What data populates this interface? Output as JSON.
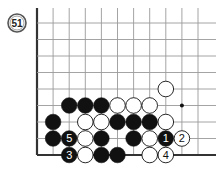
{
  "diagram": {
    "problem_number": "51",
    "grid": {
      "origin_x": 37,
      "origin_y": 23,
      "spacing_x": 16.1,
      "spacing_y": 16.5,
      "cols": 11,
      "rows": 9,
      "edges": [
        "left",
        "bottom"
      ],
      "line_color": "#9a9a9a",
      "edge_color": "#333333"
    },
    "star_points": [
      {
        "col": 9,
        "row": 5
      }
    ],
    "stones": [
      {
        "col": 8,
        "row": 4,
        "color": "white"
      },
      {
        "col": 2,
        "row": 5,
        "color": "black"
      },
      {
        "col": 3,
        "row": 5,
        "color": "black"
      },
      {
        "col": 4,
        "row": 5,
        "color": "black"
      },
      {
        "col": 5,
        "row": 5,
        "color": "white"
      },
      {
        "col": 6,
        "row": 5,
        "color": "white"
      },
      {
        "col": 7,
        "row": 5,
        "color": "white"
      },
      {
        "col": 1,
        "row": 6,
        "color": "black"
      },
      {
        "col": 3,
        "row": 6,
        "color": "white"
      },
      {
        "col": 4,
        "row": 6,
        "color": "white"
      },
      {
        "col": 5,
        "row": 6,
        "color": "black"
      },
      {
        "col": 6,
        "row": 6,
        "color": "black"
      },
      {
        "col": 7,
        "row": 6,
        "color": "black"
      },
      {
        "col": 8,
        "row": 6,
        "color": "white"
      },
      {
        "col": 1,
        "row": 7,
        "color": "black"
      },
      {
        "col": 2,
        "row": 7,
        "color": "black",
        "label": "5"
      },
      {
        "col": 3,
        "row": 7,
        "color": "white"
      },
      {
        "col": 4,
        "row": 7,
        "color": "black"
      },
      {
        "col": 6,
        "row": 7,
        "color": "black"
      },
      {
        "col": 7,
        "row": 7,
        "color": "white"
      },
      {
        "col": 8,
        "row": 7,
        "color": "black",
        "label": "1"
      },
      {
        "col": 9,
        "row": 7,
        "color": "white",
        "label": "2"
      },
      {
        "col": 2,
        "row": 8,
        "color": "black",
        "label": "3"
      },
      {
        "col": 3,
        "row": 8,
        "color": "white"
      },
      {
        "col": 4,
        "row": 8,
        "color": "black"
      },
      {
        "col": 5,
        "row": 8,
        "color": "black"
      },
      {
        "col": 7,
        "row": 8,
        "color": "white"
      },
      {
        "col": 8,
        "row": 8,
        "color": "white",
        "label": "4"
      }
    ]
  }
}
